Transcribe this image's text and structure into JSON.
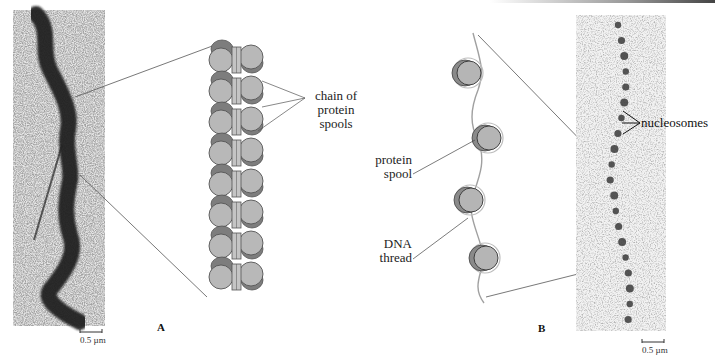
{
  "figure": {
    "panel_a": {
      "letter": "A",
      "micrograph_desc": "electron micrograph of condensed chromatin fiber",
      "scale_bar": "0.5 µm",
      "callout": "chain of\nprotein\nspools",
      "callout_lines": [
        "chain of",
        "protein",
        "spools"
      ]
    },
    "panel_b": {
      "letter": "B",
      "micrograph_desc": "electron micrograph of beads-on-a-string chromatin",
      "scale_bar": "0.5 µm",
      "labels": {
        "protein_spool": [
          "protein",
          "spool"
        ],
        "dna_thread": [
          "DNA",
          "thread"
        ],
        "nucleosomes": "nucleosomes"
      }
    },
    "colors": {
      "spool_fill": "#b8b8b8",
      "spool_dark": "#7d7d7d",
      "spool_edge": "#555555",
      "dna_thread": "#9a9a9a",
      "leader_line": "#555555"
    }
  }
}
